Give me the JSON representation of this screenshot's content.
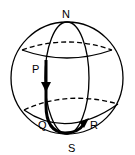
{
  "diagram": {
    "labels": {
      "north": "N",
      "south": "S",
      "p": "P",
      "q": "Q",
      "r": "R"
    },
    "colors": {
      "stroke": "#000000",
      "background": "#ffffff"
    }
  }
}
